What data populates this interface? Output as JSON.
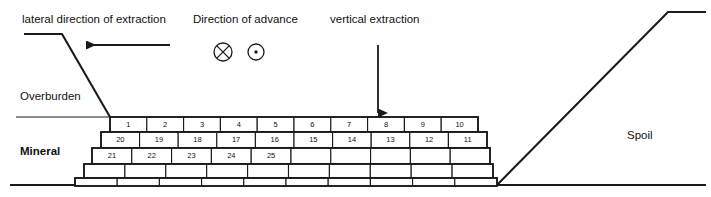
{
  "diagram": {
    "background_color": "#ffffff",
    "line_color": "#1a1a1a",
    "block_fill": "#ffffff"
  },
  "labels": {
    "lateral_direction": "lateral direction of extraction",
    "direction_of_advance": "Direction of advance",
    "vertical_extraction": "vertical extraction",
    "overburden": "Overburden",
    "mineral": "Mineral",
    "spoil": "Spoil"
  },
  "symbols": {
    "into_page": "circle-x-icon",
    "out_of_page": "circle-dot-icon",
    "lateral_arrow": "arrow-left-icon",
    "vertical_arrow": "arrow-down-icon"
  },
  "geometry": {
    "width": 711,
    "height": 197,
    "overburden_surface_y": 117,
    "baseline_y": 185,
    "highwall_top_left_x": 24,
    "highwall_crest_x": 62,
    "highwall_crest_y": 34,
    "highwall_toe_x": 110,
    "highwall_toe_y": 117,
    "spoil_toe_x": 497,
    "spoil_crest_x": 668,
    "spoil_crest_y": 12,
    "spoil_top_right_x": 706,
    "left_arrow": {
      "x1": 170,
      "y1": 45,
      "x2": 86,
      "y2": 45
    },
    "down_arrow": {
      "x1": 378,
      "y1": 45,
      "x2": 378,
      "y2": 113
    },
    "circle_x": {
      "cx": 223,
      "cy": 52,
      "r": 9
    },
    "circle_dot": {
      "cx": 256,
      "cy": 52,
      "r": 8
    }
  },
  "bench_rows": [
    {
      "row_index": 1,
      "y_top": 117,
      "y_bottom": 132,
      "x_start": 110,
      "x_end": 478,
      "block_count": 10,
      "numbers": [
        "1",
        "2",
        "3",
        "4",
        "5",
        "6",
        "7",
        "8",
        "9",
        "10"
      ]
    },
    {
      "row_index": 2,
      "y_top": 132,
      "y_bottom": 148,
      "x_start": 101,
      "x_end": 487,
      "block_count": 10,
      "numbers": [
        "20",
        "19",
        "18",
        "17",
        "16",
        "15",
        "14",
        "13",
        "12",
        "11"
      ]
    },
    {
      "row_index": 3,
      "y_top": 148,
      "y_bottom": 164,
      "x_start": 92,
      "x_end": 490,
      "block_count": 10,
      "numbers": [
        "21",
        "22",
        "23",
        "24",
        "25",
        "",
        "",
        "",
        "",
        ""
      ]
    },
    {
      "row_index": 4,
      "y_top": 164,
      "y_bottom": 178,
      "x_start": 84,
      "x_end": 493,
      "block_count": 10,
      "numbers": [
        "",
        "",
        "",
        "",
        "",
        "",
        "",
        "",
        "",
        ""
      ]
    },
    {
      "row_index": 5,
      "y_top": 178,
      "y_bottom": 186,
      "x_start": 75,
      "x_end": 497,
      "block_count": 10,
      "numbers": [
        "",
        "",
        "",
        "",
        "",
        "",
        "",
        "",
        "",
        ""
      ]
    }
  ],
  "ground_lines": [
    {
      "name": "overburden-surface-left",
      "x1": 16,
      "y1": 117,
      "x2": 110,
      "y2": 117,
      "weight": 1
    },
    {
      "name": "pit-floor-baseline",
      "x1": 10,
      "y1": 185,
      "x2": 706,
      "y2": 185,
      "weight": 2
    }
  ]
}
